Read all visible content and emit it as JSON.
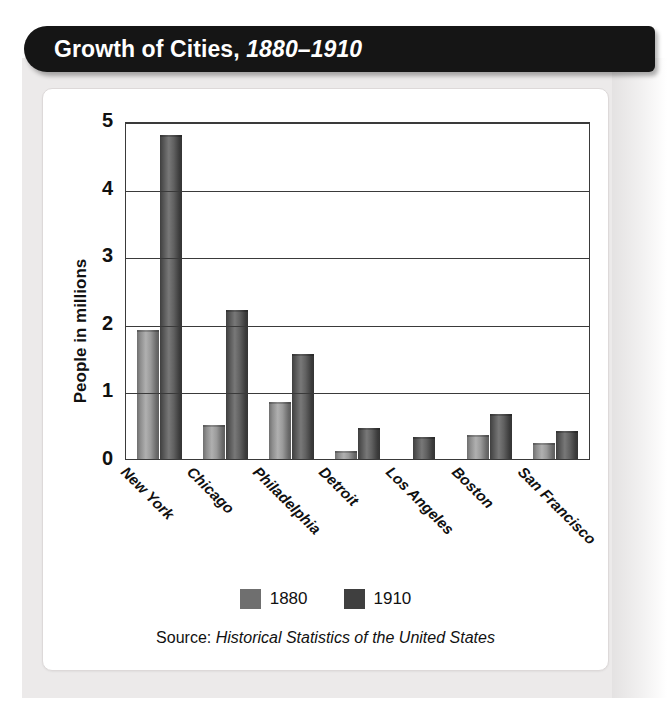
{
  "header": {
    "title_main": "Growth of Cities,",
    "title_years": "1880–1910"
  },
  "chart_data": {
    "type": "bar",
    "title": "Growth of Cities, 1880–1910",
    "xlabel": "",
    "ylabel": "People in millions",
    "ylim": [
      0,
      5
    ],
    "yticks": [
      "5",
      "4",
      "3",
      "2",
      "1",
      "0"
    ],
    "grid": true,
    "legend_position": "bottom",
    "categories": [
      "New York",
      "Chicago",
      "Philadelphia",
      "Detroit",
      "Los Angeles",
      "Boston",
      "San Francisco"
    ],
    "series": [
      {
        "name": "1880",
        "color": "#6f6f6f",
        "values": [
          1.91,
          0.5,
          0.85,
          0.12,
          0.0,
          0.36,
          0.23
        ]
      },
      {
        "name": "1910",
        "color": "#3f3f3f",
        "values": [
          4.8,
          2.2,
          1.55,
          0.46,
          0.32,
          0.67,
          0.42
        ]
      }
    ],
    "source_prefix": "Source: ",
    "source_title": "Historical Statistics of the United States"
  },
  "legend": {
    "items": [
      {
        "label": "1880"
      },
      {
        "label": "1910"
      }
    ]
  }
}
